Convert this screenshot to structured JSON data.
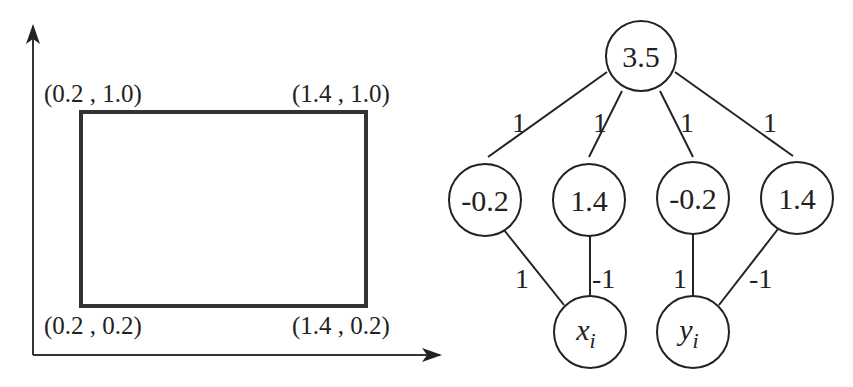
{
  "figure": {
    "left_panel": {
      "title": "",
      "axes": {
        "x_axis_arrow": true,
        "y_axis_arrow": true
      },
      "rectangle": {
        "corners": {
          "top_left": "(0.2 , 1.0)",
          "top_right": "(1.4 , 1.0)",
          "bottom_left": "(0.2 , 0.2)",
          "bottom_right": "(1.4 , 0.2)"
        }
      }
    },
    "right_panel": {
      "output_node": {
        "label": "3.5"
      },
      "hidden_nodes": [
        {
          "label": "-0.2"
        },
        {
          "label": "1.4"
        },
        {
          "label": "-0.2"
        },
        {
          "label": "1.4"
        }
      ],
      "input_nodes": [
        {
          "base": "x",
          "sub": "i"
        },
        {
          "base": "y",
          "sub": "i"
        }
      ],
      "top_weights": [
        "1",
        "1",
        "1",
        "1"
      ],
      "bottom_weights": [
        "1",
        "-1",
        "1",
        "-1"
      ]
    }
  }
}
